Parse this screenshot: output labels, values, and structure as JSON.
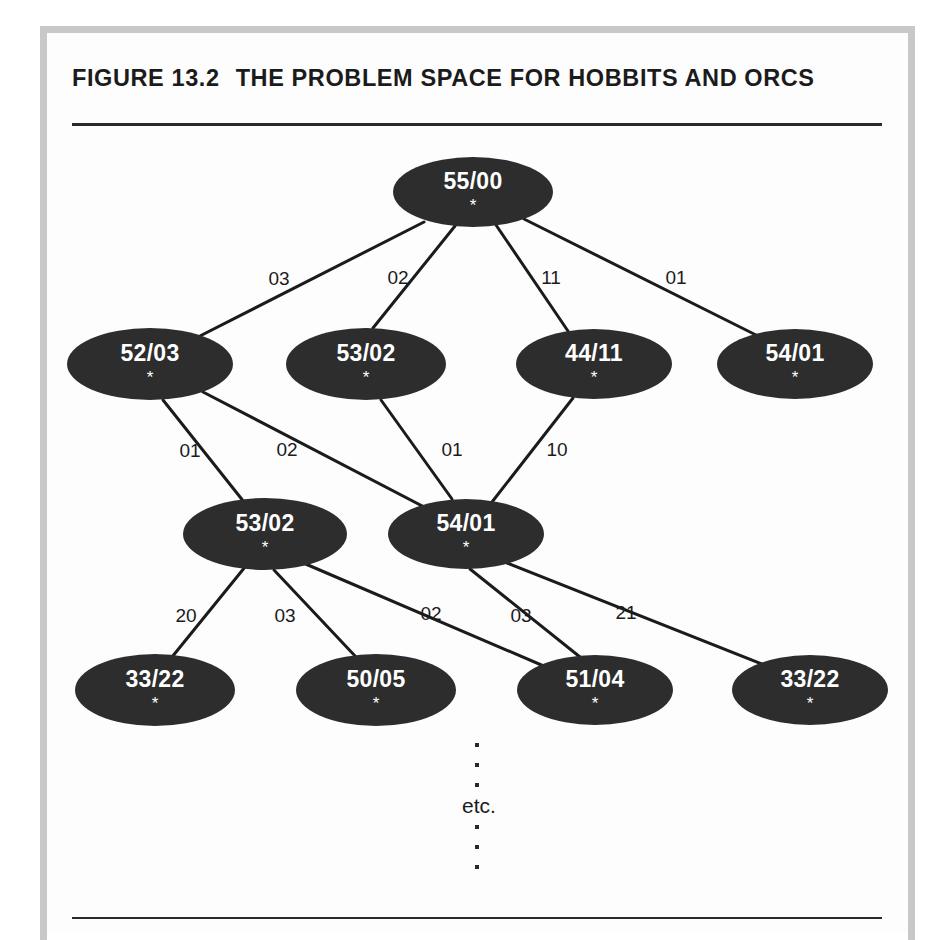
{
  "figure": {
    "number": "FIGURE 13.2",
    "title": "THE PROBLEM SPACE FOR HOBBITS AND ORCS"
  },
  "diagram": {
    "type": "tree",
    "node_star": "*",
    "node_fill": "#2d2d2d",
    "node_text_color": "#ffffff",
    "edge_color": "#1b1b1b",
    "nodes": [
      {
        "id": "n0",
        "label": "55/00",
        "star": "*",
        "level": 0,
        "cx": 473,
        "cy": 192,
        "rx": 80,
        "ry": 35
      },
      {
        "id": "n1",
        "label": "52/03",
        "star": "*",
        "level": 1,
        "cx": 150,
        "cy": 364,
        "rx": 83,
        "ry": 36
      },
      {
        "id": "n2",
        "label": "53/02",
        "star": "*",
        "level": 1,
        "cx": 366,
        "cy": 364,
        "rx": 80,
        "ry": 36
      },
      {
        "id": "n3",
        "label": "44/11",
        "star": "*",
        "level": 1,
        "cx": 594,
        "cy": 364,
        "rx": 78,
        "ry": 35
      },
      {
        "id": "n4",
        "label": "54/01",
        "star": "*",
        "level": 1,
        "cx": 795,
        "cy": 364,
        "rx": 78,
        "ry": 35
      },
      {
        "id": "n5",
        "label": "53/02",
        "star": "*",
        "level": 2,
        "cx": 265,
        "cy": 534,
        "rx": 82,
        "ry": 36
      },
      {
        "id": "n6",
        "label": "54/01",
        "star": "*",
        "level": 2,
        "cx": 466,
        "cy": 534,
        "rx": 78,
        "ry": 35
      },
      {
        "id": "n7",
        "label": "33/22",
        "star": "*",
        "level": 3,
        "cx": 155,
        "cy": 690,
        "rx": 80,
        "ry": 36
      },
      {
        "id": "n8",
        "label": "50/05",
        "star": "*",
        "level": 3,
        "cx": 376,
        "cy": 690,
        "rx": 80,
        "ry": 36
      },
      {
        "id": "n9",
        "label": "51/04",
        "star": "*",
        "level": 3,
        "cx": 595,
        "cy": 690,
        "rx": 78,
        "ry": 35
      },
      {
        "id": "n10",
        "label": "33/22",
        "star": "*",
        "level": 3,
        "cx": 810,
        "cy": 690,
        "rx": 78,
        "ry": 35
      }
    ],
    "edges": [
      {
        "from": "n0",
        "to": "n1",
        "label": "03",
        "lx": 279,
        "ly": 279,
        "x1": 424,
        "y1": 222,
        "x2": 196,
        "y2": 338
      },
      {
        "from": "n0",
        "to": "n2",
        "label": "02",
        "lx": 398,
        "ly": 278,
        "x1": 455,
        "y1": 226,
        "x2": 373,
        "y2": 328
      },
      {
        "from": "n0",
        "to": "n3",
        "label": "11",
        "lx": 551,
        "ly": 278,
        "x1": 496,
        "y1": 225,
        "x2": 570,
        "y2": 334
      },
      {
        "from": "n0",
        "to": "n4",
        "label": "01",
        "lx": 676,
        "ly": 278,
        "x1": 524,
        "y1": 219,
        "x2": 758,
        "y2": 336
      },
      {
        "from": "n1",
        "to": "n5",
        "label": "01",
        "lx": 190,
        "ly": 451,
        "x1": 163,
        "y1": 400,
        "x2": 244,
        "y2": 502
      },
      {
        "from": "n1",
        "to": "n6",
        "label": "02",
        "lx": 287,
        "ly": 450,
        "x1": 203,
        "y1": 392,
        "x2": 430,
        "y2": 510
      },
      {
        "from": "n2",
        "to": "n6",
        "label": "01",
        "lx": 452,
        "ly": 450,
        "x1": 381,
        "y1": 400,
        "x2": 452,
        "y2": 499
      },
      {
        "from": "n3",
        "to": "n6",
        "label": "10",
        "lx": 557,
        "ly": 450,
        "x1": 573,
        "y1": 398,
        "x2": 492,
        "y2": 502
      },
      {
        "from": "n5",
        "to": "n7",
        "label": "20",
        "lx": 186,
        "ly": 616,
        "x1": 245,
        "y1": 567,
        "x2": 172,
        "y2": 657
      },
      {
        "from": "n5",
        "to": "n8",
        "label": "03",
        "lx": 285,
        "ly": 616,
        "x1": 274,
        "y1": 570,
        "x2": 356,
        "y2": 657
      },
      {
        "from": "n5",
        "to": "n9",
        "label": "02",
        "lx": 431,
        "ly": 614,
        "x1": 301,
        "y1": 562,
        "x2": 553,
        "y2": 670
      },
      {
        "from": "n6",
        "to": "n9",
        "label": "03",
        "lx": 521,
        "ly": 616,
        "x1": 470,
        "y1": 569,
        "x2": 580,
        "y2": 657
      },
      {
        "from": "n6",
        "to": "n10",
        "label": "21",
        "lx": 626,
        "ly": 613,
        "x1": 502,
        "y1": 561,
        "x2": 772,
        "y2": 668
      }
    ],
    "continuation": {
      "label": "etc.",
      "label_x": 479,
      "label_y": 806,
      "dots_x": 477,
      "dots_above_y": [
        745,
        765,
        785
      ],
      "dots_below_y": [
        827,
        847,
        867
      ]
    }
  }
}
